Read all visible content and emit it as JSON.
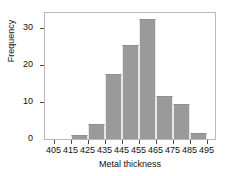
{
  "chart_data": {
    "type": "bar",
    "subtype": "histogram",
    "title": "",
    "xlabel": "Metal thickness",
    "ylabel": "Frequency",
    "bin_width": 10,
    "bin_edges": [
      405,
      415,
      425,
      435,
      445,
      455,
      465,
      475,
      485,
      495
    ],
    "categories": [
      "405-415",
      "415-425",
      "425-435",
      "435-445",
      "445-455",
      "455-465",
      "465-475",
      "475-485",
      "485-495"
    ],
    "values": [
      0,
      1,
      4,
      17.5,
      25.5,
      32.5,
      11.5,
      9.5,
      1.5
    ],
    "xlim": [
      400,
      500
    ],
    "ylim": [
      0,
      34
    ],
    "xticks": [
      405,
      415,
      425,
      435,
      445,
      455,
      465,
      475,
      485,
      495
    ],
    "xtick_labels": [
      "405",
      "415",
      "425",
      "435",
      "445",
      "455",
      "465",
      "475",
      "485",
      "495"
    ],
    "yticks": [
      0,
      10,
      20,
      30
    ],
    "ytick_labels": [
      "0",
      "10",
      "20",
      "30"
    ],
    "grid": false,
    "legend": false,
    "bar_color": "#9a9a9a",
    "bar_edge_color": "#e8e8e8",
    "frame_color": "#b9b9b9",
    "axis_color": "#4a4a4a",
    "text_color": "#111111",
    "background": "#ffffff"
  }
}
